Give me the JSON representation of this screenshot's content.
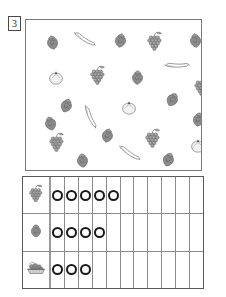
{
  "worksheet": {
    "exercise_number": "3",
    "background_color": "#ffffff",
    "ink_color": "#6e6e6e",
    "grid_line_color": "#8a8a8a",
    "ring_color": "#1a1a1a"
  },
  "picture_panel": {
    "name": "fruit-picture-panel",
    "fruits": [
      {
        "type": "strawberry",
        "x": 20,
        "y": 15,
        "rot": -12,
        "scale": 1.0
      },
      {
        "type": "banana",
        "x": 47,
        "y": 12,
        "rot": 8,
        "scale": 1.0
      },
      {
        "type": "strawberry",
        "x": 88,
        "y": 13,
        "rot": 10,
        "scale": 1.0
      },
      {
        "type": "grapes",
        "x": 120,
        "y": 11,
        "rot": 0,
        "scale": 1.0
      },
      {
        "type": "strawberry",
        "x": 163,
        "y": 13,
        "rot": -8,
        "scale": 1.0
      },
      {
        "type": "orange",
        "x": 22,
        "y": 50,
        "rot": 0,
        "scale": 1.0
      },
      {
        "type": "grapes",
        "x": 63,
        "y": 45,
        "rot": 0,
        "scale": 1.0
      },
      {
        "type": "strawberry",
        "x": 105,
        "y": 50,
        "rot": 4,
        "scale": 1.0
      },
      {
        "type": "banana",
        "x": 139,
        "y": 38,
        "rot": -24,
        "scale": 1.0
      },
      {
        "type": "grapes",
        "x": 167,
        "y": 56,
        "rot": 0,
        "scale": 1.0
      },
      {
        "type": "strawberry",
        "x": 34,
        "y": 78,
        "rot": 22,
        "scale": 1.0
      },
      {
        "type": "strawberry",
        "x": 140,
        "y": 72,
        "rot": 30,
        "scale": 1.0
      },
      {
        "type": "orange",
        "x": 95,
        "y": 80,
        "rot": 0,
        "scale": 1.0
      },
      {
        "type": "banana",
        "x": 53,
        "y": 90,
        "rot": 42,
        "scale": 1.0
      },
      {
        "type": "strawberry",
        "x": 18,
        "y": 96,
        "rot": -18,
        "scale": 1.0
      },
      {
        "type": "strawberry",
        "x": 166,
        "y": 92,
        "rot": 12,
        "scale": 1.0
      },
      {
        "type": "grapes",
        "x": 22,
        "y": 112,
        "rot": 0,
        "scale": 1.0
      },
      {
        "type": "strawberry",
        "x": 75,
        "y": 108,
        "rot": 14,
        "scale": 1.0
      },
      {
        "type": "grapes",
        "x": 118,
        "y": 108,
        "rot": 0,
        "scale": 1.0
      },
      {
        "type": "orange",
        "x": 164,
        "y": 118,
        "rot": 0,
        "scale": 1.0
      },
      {
        "type": "strawberry",
        "x": 50,
        "y": 133,
        "rot": -6,
        "scale": 1.0
      },
      {
        "type": "banana",
        "x": 92,
        "y": 126,
        "rot": 10,
        "scale": 1.0
      },
      {
        "type": "strawberry",
        "x": 136,
        "y": 132,
        "rot": 20,
        "scale": 1.0
      }
    ]
  },
  "tally_grid": {
    "name": "fruit-tally-grid",
    "column_count": 11,
    "rows": [
      {
        "icon": "grapes-icon",
        "label": "grapes",
        "count": 5
      },
      {
        "icon": "strawberry-icon",
        "label": "strawberry",
        "count": 4
      },
      {
        "icon": "fruit-basket-icon",
        "label": "fruit basket",
        "count": 3
      }
    ]
  }
}
